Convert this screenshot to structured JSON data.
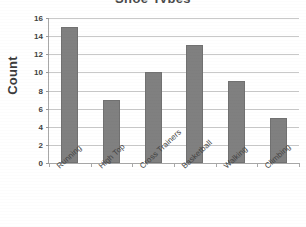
{
  "chart_data": {
    "type": "bar",
    "title": "Shoe Types",
    "xlabel": "",
    "ylabel": "Count",
    "categories": [
      "Running",
      "High Top",
      "Cross Trainers",
      "Basketball",
      "Walking",
      "Climbing"
    ],
    "values": [
      15,
      7,
      10,
      13,
      9,
      5
    ],
    "ylim": [
      0,
      16
    ],
    "ytick_step": 2,
    "ytick_labels": [
      "0",
      "2",
      "4",
      "6",
      "8",
      "10",
      "12",
      "14",
      "16"
    ],
    "grid": true,
    "grid_axis": "y",
    "legend": false,
    "legend_position": "none",
    "bar_color": "#808080",
    "bar_border_color": "#717171",
    "gridline_color": "#c9c9c9",
    "axis_color": "#a8a8a8",
    "text_color": "#3f3f3f",
    "xtick_label_rotation": -43
  }
}
